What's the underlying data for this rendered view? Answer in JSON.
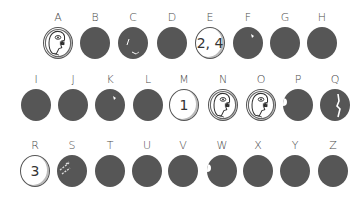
{
  "grid": {
    "rows": [
      {
        "label_y": 12,
        "cells": [
          {
            "letter": "A",
            "x": 58,
            "state": "face",
            "text": ""
          },
          {
            "letter": "B",
            "x": 95,
            "state": "dark",
            "text": ""
          },
          {
            "letter": "C",
            "x": 133,
            "state": "dark-chipped",
            "text": ""
          },
          {
            "letter": "D",
            "x": 172,
            "state": "dark",
            "text": ""
          },
          {
            "letter": "E",
            "x": 210,
            "state": "number",
            "text": "2, 4"
          },
          {
            "letter": "F",
            "x": 248,
            "state": "dark-glint",
            "text": ""
          },
          {
            "letter": "G",
            "x": 285,
            "state": "dark",
            "text": ""
          },
          {
            "letter": "H",
            "x": 322,
            "state": "dark",
            "text": ""
          }
        ]
      },
      {
        "label_y": 74,
        "cells": [
          {
            "letter": "I",
            "x": 36,
            "state": "dark",
            "text": ""
          },
          {
            "letter": "J",
            "x": 73,
            "state": "dark",
            "text": ""
          },
          {
            "letter": "K",
            "x": 110,
            "state": "dark-glint",
            "text": ""
          },
          {
            "letter": "L",
            "x": 148,
            "state": "dark",
            "text": ""
          },
          {
            "letter": "M",
            "x": 184,
            "state": "number",
            "text": "1"
          },
          {
            "letter": "N",
            "x": 223,
            "state": "face",
            "text": ""
          },
          {
            "letter": "O",
            "x": 261,
            "state": "face",
            "text": ""
          },
          {
            "letter": "P",
            "x": 298,
            "state": "dark-notch",
            "text": ""
          },
          {
            "letter": "Q",
            "x": 335,
            "state": "dark-crack",
            "text": ""
          }
        ]
      },
      {
        "label_y": 140,
        "cells": [
          {
            "letter": "R",
            "x": 35,
            "state": "number",
            "text": "3"
          },
          {
            "letter": "S",
            "x": 72,
            "state": "dark-scratch",
            "text": ""
          },
          {
            "letter": "T",
            "x": 110,
            "state": "dark",
            "text": ""
          },
          {
            "letter": "U",
            "x": 147,
            "state": "dark",
            "text": ""
          },
          {
            "letter": "V",
            "x": 183,
            "state": "dark",
            "text": ""
          },
          {
            "letter": "W",
            "x": 222,
            "state": "dark-notch",
            "text": ""
          },
          {
            "letter": "X",
            "x": 258,
            "state": "dark",
            "text": ""
          },
          {
            "letter": "Y",
            "x": 295,
            "state": "dark",
            "text": ""
          },
          {
            "letter": "Z",
            "x": 333,
            "state": "dark",
            "text": ""
          }
        ]
      }
    ]
  },
  "colors": {
    "dark_disc": "#565656",
    "light_disc": "#ffffff",
    "label": "#4a4a4a"
  }
}
